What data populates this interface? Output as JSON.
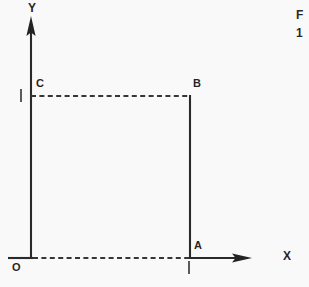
{
  "figure": {
    "kind": "coordinate-geometry-diagram",
    "background_color": "#faf9f9",
    "ink_color": "#161616",
    "width": 309,
    "height": 287,
    "axes": {
      "y_axis_label": "Y",
      "x_axis_label": "X",
      "origin_label": "O",
      "origin_px": {
        "x": 31,
        "y": 258
      },
      "y_axis_top_px": 18,
      "x_axis_right_px": 250,
      "x_axis_left_stub_px": 8,
      "arrowheads": [
        "y-axis-arrowhead",
        "x-axis-arrowhead"
      ]
    },
    "points": [
      {
        "id": "A",
        "label": "A",
        "px": {
          "x": 190,
          "y": 258
        },
        "label_px": {
          "x": 194,
          "y": 241
        },
        "on": "x-axis"
      },
      {
        "id": "B",
        "label": "B",
        "px": {
          "x": 190,
          "y": 96
        },
        "label_px": {
          "x": 193,
          "y": 79
        },
        "on": "corner"
      },
      {
        "id": "C",
        "label": "C",
        "px": {
          "x": 31,
          "y": 96
        },
        "label_px": {
          "x": 35,
          "y": 79
        },
        "on": "y-axis"
      }
    ],
    "ticks": [
      {
        "id": "tick-y-at-C",
        "label": "I",
        "px": {
          "x": 20,
          "y": 90
        },
        "axis": "y"
      },
      {
        "id": "tick-x-at-A",
        "label": "I",
        "px": {
          "x": 188,
          "y": 262
        },
        "axis": "x"
      }
    ],
    "segments": [
      {
        "id": "segment-C-to-B",
        "from": "C",
        "to": "B",
        "style": "dashed",
        "orientation": "horizontal"
      },
      {
        "id": "segment-B-to-A",
        "from": "B",
        "to": "A",
        "style": "solid",
        "orientation": "vertical"
      },
      {
        "id": "segment-O-to-A",
        "from": "O",
        "to": "A",
        "style": "dashed",
        "orientation": "horizontal"
      }
    ]
  },
  "caption": {
    "line1": "F",
    "line2": "1",
    "note": "caption text cropped at right edge"
  }
}
